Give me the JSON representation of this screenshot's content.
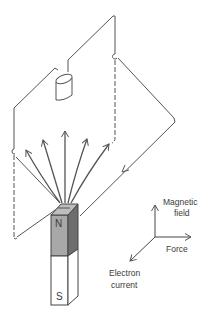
{
  "diagram": {
    "type": "physics-illustration",
    "magnet": {
      "north_label": "N",
      "south_label": "S",
      "north_color": "#a8a8a8",
      "north_side_color": "#6e6e6e",
      "south_color": "#ffffff"
    },
    "axes": {
      "up_label_line1": "Magnetic",
      "up_label_line2": "field",
      "right_label": "Force",
      "down_left_label_line1": "Electron",
      "down_left_label_line2": "current"
    },
    "colors": {
      "line": "#444444",
      "field_line": "#555555",
      "text": "#3a3a3a"
    }
  }
}
